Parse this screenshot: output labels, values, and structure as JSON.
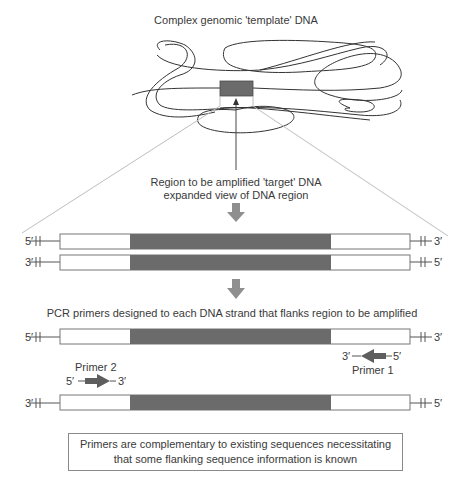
{
  "diagram": {
    "title": "Complex genomic 'template' DNA",
    "target_label_line1": "Region to be amplified 'target' DNA",
    "target_label_line2": "expanded view of DNA region",
    "primers_heading": "PCR primers designed to each DNA strand that flanks region to be amplified",
    "note_line1": "Primers are complementary to existing sequences necessitating",
    "note_line2": "that some flanking sequence information is known"
  },
  "strands_expanded": [
    {
      "left_end": "5′",
      "right_end": "3′"
    },
    {
      "left_end": "3′",
      "right_end": "5′"
    }
  ],
  "strands_primed": [
    {
      "left_end": "5′",
      "right_end": "3′"
    },
    {
      "left_end": "3′",
      "right_end": "5′"
    }
  ],
  "primers": {
    "primer1": {
      "label": "Primer 1",
      "left_end": "3′",
      "right_end": "5′",
      "direction": "left"
    },
    "primer2": {
      "label": "Primer 2",
      "left_end": "5′",
      "right_end": "3′",
      "direction": "right"
    }
  },
  "colors": {
    "target_region": "#6b6b6b",
    "flank_region": "#ffffff",
    "process_arrow": "#8f8f8f",
    "primer_arrow": "#5e5e5e",
    "dna_line": "#333333",
    "zoom_lines": "#bdbdbd"
  }
}
